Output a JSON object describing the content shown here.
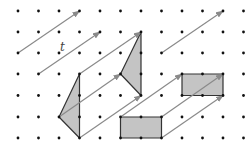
{
  "diagram": {
    "title": "",
    "vector_label": "t",
    "grid": {
      "cols": [
        18,
        38.5,
        59,
        79.5,
        100,
        120.5,
        141,
        161.5,
        182,
        202.5,
        223,
        243.5
      ],
      "rows": [
        11,
        32,
        53,
        74,
        95.5,
        117,
        138
      ]
    },
    "colors": {
      "dot": "#111111",
      "arrow": "#8a8a8a",
      "shape_fill": "#c4c4c4",
      "shape_stroke": "#333333"
    },
    "translation": {
      "dcol": 3,
      "drow": -2
    },
    "shapes": [
      {
        "name": "triangle-original",
        "points": [
          [
            2,
            5
          ],
          [
            3,
            3
          ],
          [
            3,
            6
          ]
        ]
      },
      {
        "name": "triangle-image",
        "points": [
          [
            5,
            3
          ],
          [
            6,
            1
          ],
          [
            6,
            4
          ]
        ]
      },
      {
        "name": "rectangle-original",
        "points": [
          [
            5,
            5
          ],
          [
            7,
            5
          ],
          [
            7,
            6
          ],
          [
            5,
            6
          ]
        ]
      },
      {
        "name": "rectangle-image",
        "points": [
          [
            8,
            3
          ],
          [
            10,
            3
          ],
          [
            10,
            4
          ],
          [
            8,
            4
          ]
        ]
      }
    ],
    "arrows": [
      {
        "from": [
          0,
          2
        ],
        "to": [
          3,
          0
        ]
      },
      {
        "from": [
          1,
          3
        ],
        "to": [
          4,
          1
        ]
      },
      {
        "from": [
          3,
          3
        ],
        "to": [
          6,
          1
        ]
      },
      {
        "from": [
          2,
          5
        ],
        "to": [
          5,
          3
        ]
      },
      {
        "from": [
          3,
          6
        ],
        "to": [
          6,
          4
        ]
      },
      {
        "from": [
          7,
          2
        ],
        "to": [
          10,
          0
        ]
      },
      {
        "from": [
          5,
          5
        ],
        "to": [
          8,
          3
        ]
      },
      {
        "from": [
          7,
          5
        ],
        "to": [
          10,
          3
        ]
      },
      {
        "from": [
          7,
          6
        ],
        "to": [
          10,
          4
        ]
      }
    ]
  }
}
